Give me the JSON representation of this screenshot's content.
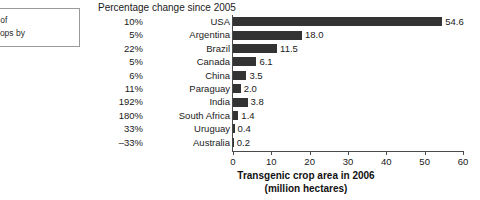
{
  "caption_box": {
    "lines": [
      "area of",
      "ed crops by"
    ]
  },
  "chart_data": {
    "type": "bar",
    "orientation": "horizontal",
    "title": "",
    "header_label": "Percentage change since 2005",
    "xlabel": "Transgenic crop area in 2006",
    "xlabel_sub": "(million hectares)",
    "ylabel": "",
    "xlim": [
      0,
      60
    ],
    "xticks": [
      0,
      10,
      20,
      30,
      40,
      50,
      60
    ],
    "xtick_labels": [
      "0",
      "10",
      "20",
      "30",
      "40",
      "50",
      "60"
    ],
    "grid": false,
    "legend": false,
    "bar_color": "#333333",
    "categories": [
      "USA",
      "Argentina",
      "Brazil",
      "Canada",
      "China",
      "Paraguay",
      "India",
      "South Africa",
      "Uruguay",
      "Australia"
    ],
    "values": [
      54.6,
      18.0,
      11.5,
      6.1,
      3.5,
      2.0,
      3.8,
      1.4,
      0.4,
      0.2
    ],
    "value_labels": [
      "54.6",
      "18.0",
      "11.5",
      "6.1",
      "3.5",
      "2.0",
      "3.8",
      "1.4",
      "0.4",
      "0.2"
    ],
    "percent_change_labels": [
      "10%",
      "5%",
      "22%",
      "5%",
      "6%",
      "11%",
      "192%",
      "180%",
      "33%",
      "–33%"
    ],
    "percent_change_values": [
      10,
      5,
      22,
      5,
      6,
      11,
      192,
      180,
      33,
      -33
    ],
    "series": [
      {
        "name": "Transgenic crop area in 2006 (million hectares)",
        "values": [
          54.6,
          18.0,
          11.5,
          6.1,
          3.5,
          2.0,
          3.8,
          1.4,
          0.4,
          0.2
        ]
      }
    ]
  }
}
